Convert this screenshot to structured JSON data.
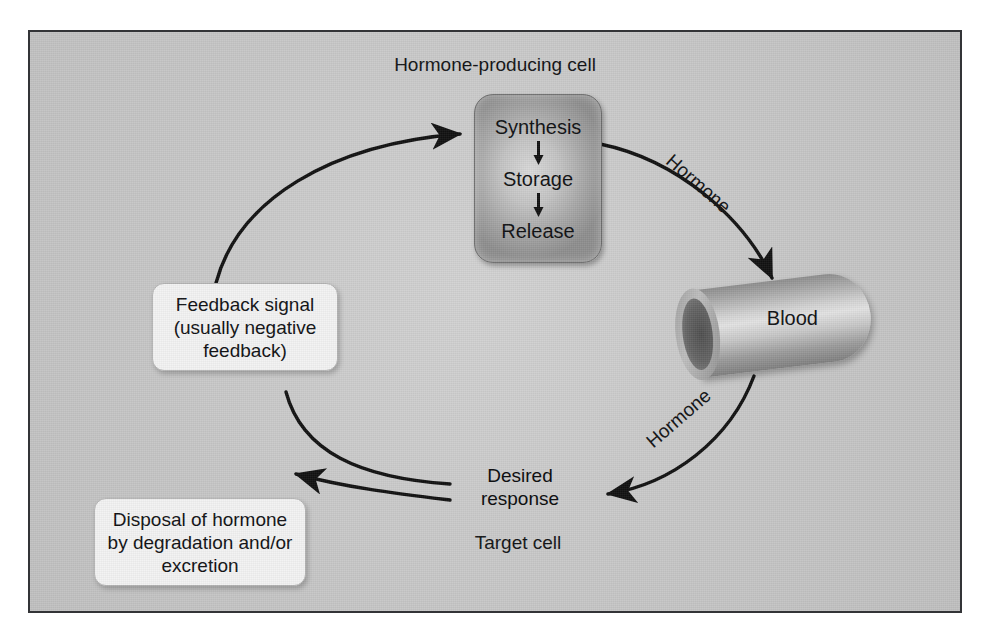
{
  "figure": {
    "title_caption": "Hormone-producing cell",
    "target_cell_caption": "Target cell"
  },
  "cell": {
    "steps": [
      "Synthesis",
      "Storage",
      "Release"
    ]
  },
  "blood": {
    "label": "Blood"
  },
  "boxes": {
    "feedback_signal": "Feedback signal (usually negative feedback)",
    "disposal": "Disposal of hormone by degradation and/or excretion",
    "desired_response": "Desired response"
  },
  "flow_labels": {
    "hormone_upper": "Hormone",
    "hormone_lower": "Hormone"
  },
  "colors": {
    "panel_background": "#c6c6c6",
    "panel_border": "#333437",
    "text": "#0f1012",
    "arrow": "#111111",
    "soft_box_fill": "#f2f2f2",
    "cell_fill_center": "#d9d9d9",
    "cell_fill_edge": "#8e8e8e"
  },
  "diagram_flow": [
    {
      "from": "Hormone-producing cell",
      "to": "Blood",
      "label": "Hormone"
    },
    {
      "from": "Blood",
      "to": "Desired response",
      "label": "Hormone"
    },
    {
      "from": "Desired response",
      "to": "Disposal of hormone by degradation and/or excretion",
      "label": ""
    },
    {
      "from": "Desired response",
      "to": "Feedback signal (usually negative feedback)",
      "label": ""
    },
    {
      "from": "Feedback signal (usually negative feedback)",
      "to": "Hormone-producing cell",
      "label": ""
    }
  ]
}
